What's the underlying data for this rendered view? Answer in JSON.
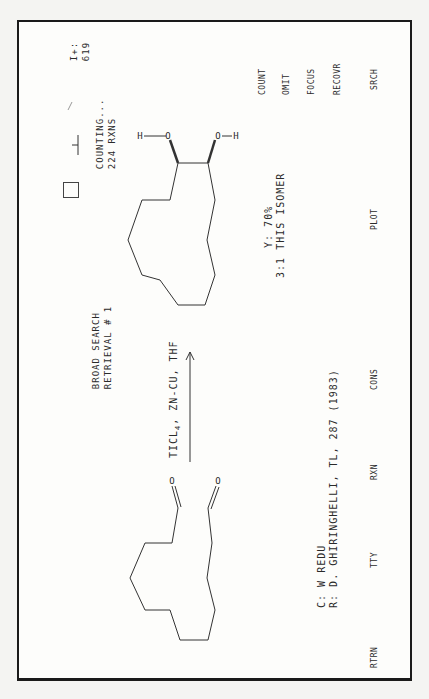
{
  "header": {
    "search_type": "BROAD SEARCH",
    "retrieval": "RETRIEVAL # 1",
    "status": "COUNTING...",
    "result_count": "224 RXNS",
    "id_label": "I+:",
    "id_value": "619"
  },
  "reaction": {
    "reagents": "TICL4, ZN-CU, THF",
    "reagents_main": "TICL",
    "reagents_sub": "4",
    "reagents_rest": ", ZN-CU, THF",
    "reactant": "cyclic dialdehyde (macrocycle with two C=O)",
    "product": "cyclic 1,2-diol (OH, OH)",
    "product_labels": {
      "h1": "H",
      "o1": "O",
      "h2": "H",
      "o2": "O"
    },
    "reactant_labels": {
      "o1": "O",
      "o2": "O"
    },
    "yield": "Y: 70%",
    "isomer_ratio": "3:1 THIS ISOMER"
  },
  "citation": {
    "class": "C: W REDU",
    "reference": "R: D. GHIRINGHELLI, TL, 287 (1983)"
  },
  "menu_right": [
    "COUNT",
    "OMIT",
    "FOCUS",
    "RECOVR",
    "SRCH"
  ],
  "menu_bottom": [
    "RTRN",
    "TTY",
    "RXN",
    "CONS",
    "PLOT"
  ],
  "colors": {
    "ink": "#2a2a2a",
    "frame": "#1a1a1a",
    "paper": "#fdfdfb"
  }
}
